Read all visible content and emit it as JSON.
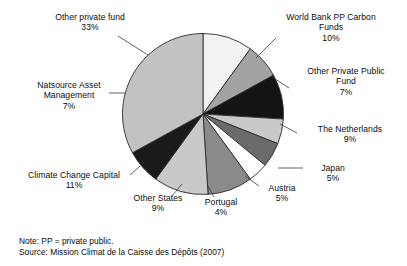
{
  "chart_data": {
    "type": "pie",
    "title": "",
    "categories": [
      "World Bank PP Carbon Funds",
      "Other Private Public Fund",
      "The Netherlands",
      "Japan",
      "Austria",
      "Portugal",
      "Other States",
      "Climate Change Capital",
      "Natsource Asset Management",
      "Other private fund"
    ],
    "values": [
      10,
      7,
      9,
      5,
      5,
      4,
      9,
      11,
      7,
      33
    ],
    "value_unit": "%",
    "start_angle_deg": 0,
    "direction": "clockwise",
    "legend": "none",
    "labels_position": "outside-with-leader-lines",
    "slices": [
      {
        "label": "World Bank PP Carbon Funds",
        "value": 10,
        "display": "10%",
        "color": "#f3f3f3"
      },
      {
        "label": "Other Private Public Fund",
        "value": 7,
        "display": "7%",
        "color": "#a3a3a3"
      },
      {
        "label": "The Netherlands",
        "value": 9,
        "display": "9%",
        "color": "#141414"
      },
      {
        "label": "Japan",
        "value": 5,
        "display": "5%",
        "color": "#c9c9c9"
      },
      {
        "label": "Austria",
        "value": 5,
        "display": "5%",
        "color": "#6b6b6b"
      },
      {
        "label": "Portugal",
        "value": 4,
        "display": "4%",
        "color": "#ffffff"
      },
      {
        "label": "Other States",
        "value": 9,
        "display": "9%",
        "color": "#8a8a8a"
      },
      {
        "label": "Climate Change Capital",
        "value": 11,
        "display": "11%",
        "color": "#c9c9c9"
      },
      {
        "label": "Natsource Asset Management",
        "value": 7,
        "display": "7%",
        "color": "#1a1a1a"
      },
      {
        "label": "Other private fund",
        "value": 33,
        "display": "33%",
        "color": "#c2c2c2"
      }
    ]
  },
  "labels": {
    "other_private_fund": {
      "name": "Other private fund",
      "pct": "33%"
    },
    "world_bank": {
      "name": "World Bank PP Carbon",
      "name2": "Funds",
      "pct": "10%"
    },
    "other_private_public": {
      "name": "Other Private Public",
      "name2": "Fund",
      "pct": "7%"
    },
    "netherlands": {
      "name": "The Netherlands",
      "pct": "9%"
    },
    "japan": {
      "name": "Japan",
      "pct": "5%"
    },
    "austria": {
      "name": "Austria",
      "pct": "5%"
    },
    "portugal": {
      "name": "Portugal",
      "pct": "4%"
    },
    "other_states": {
      "name": "Other States",
      "pct": "9%"
    },
    "climate_change": {
      "name": "Climate Change Capital",
      "pct": "11%"
    },
    "natsource": {
      "name": "Natsource Asset",
      "name2": "Management",
      "pct": "7%"
    }
  },
  "footnotes": {
    "note": "Note: PP = private public.",
    "source": "Source: Mission Climat de la Caisse des Dépôts (2007)"
  },
  "colors": {
    "stroke": "#2b2b2b",
    "text": "#0d0d0d",
    "background": "#ffffff"
  }
}
